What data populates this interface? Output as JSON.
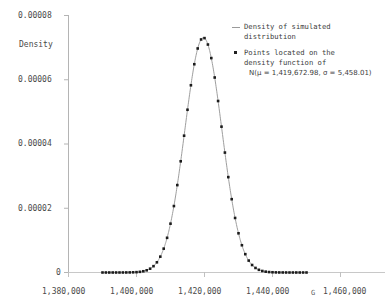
{
  "chart_data": {
    "type": "line",
    "title": "",
    "xlabel": "G",
    "ylabel": "Density",
    "xlim": [
      1380000,
      1460000
    ],
    "ylim": [
      0,
      8e-05
    ],
    "grid": false,
    "legend_position": "top-right",
    "xticks": [
      "1,380,000",
      "1,400,000",
      "1,420,000",
      "1,440,000",
      "1,460,000"
    ],
    "xtick_values": [
      1380000,
      1400000,
      1420000,
      1440000,
      1460000
    ],
    "yticks": [
      "0",
      "0.00002",
      "0.00004",
      "0.00006",
      "0.00008"
    ],
    "ytick_values": [
      0,
      2e-05,
      4e-05,
      6e-05,
      8e-05
    ],
    "distribution": {
      "family": "Normal",
      "mu": 1419672.98,
      "sigma": 5458.01,
      "peak_density": 7.31e-05
    },
    "series": [
      {
        "name": "Density of simulated distribution",
        "style": "line",
        "color": "#9a9a9a"
      },
      {
        "name": "Points located on the density function of N(mu = 1,419,672.98, sigma = 5,458.01)",
        "style": "points",
        "color": "#202020",
        "point_spacing": 1000
      }
    ],
    "annotations": []
  },
  "legend": {
    "entries": [
      {
        "marker": "line",
        "label": "Density of simulated\ndistribution",
        "formula": ""
      },
      {
        "marker": "dot",
        "label": "Points located on the\ndensity function of",
        "formula": "N(μ = 1,419,672.98, σ = 5,458.01)"
      }
    ]
  },
  "axes": {
    "y_axis_title": "Density",
    "x_axis_title": "G",
    "x_tick_labels": [
      "1,380,000",
      "1,400,000",
      "1,420,000",
      "1,440,000",
      "1,460,000"
    ],
    "y_tick_labels": [
      "0.00008",
      "0.00006",
      "0.00004",
      "0.00002",
      "0"
    ]
  }
}
